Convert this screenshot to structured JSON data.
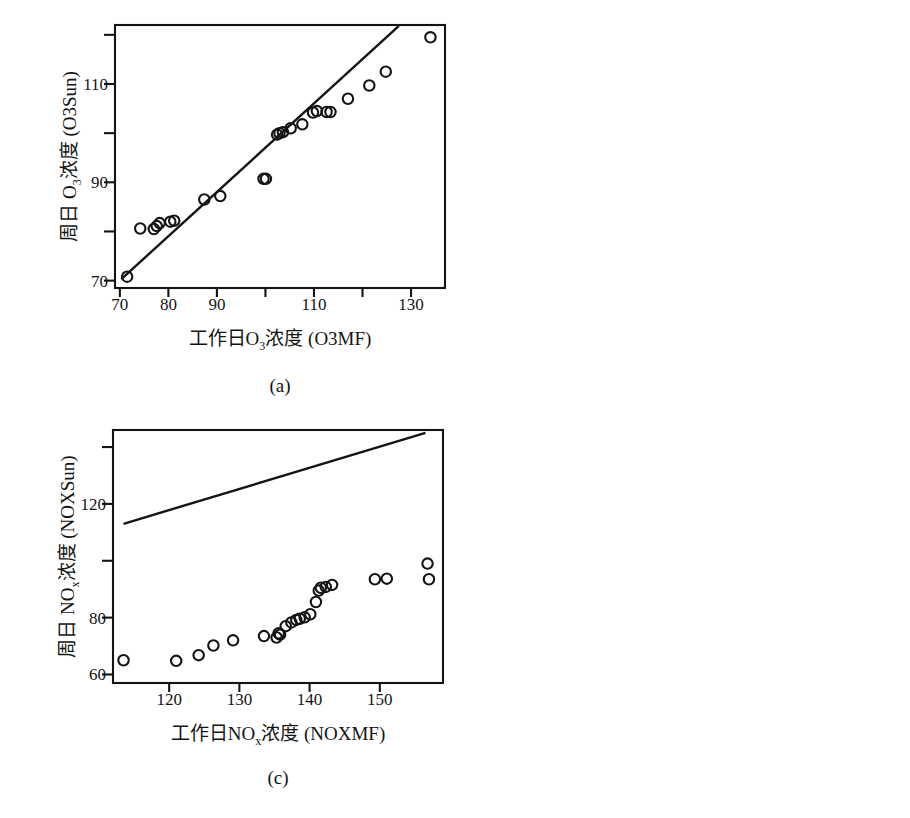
{
  "figure": {
    "title": "",
    "panel_count": 4,
    "layout": "2x2 grid",
    "marker": "open-circle",
    "line_color": "#141414",
    "background": "#ffffff"
  },
  "chart_data": [
    {
      "type": "scatter",
      "panel": "a",
      "caption": "(a)",
      "title": "",
      "xlabel": "工作日O₃浓度 (O3MF)",
      "xlabel_parts": {
        "pre": "工作日O",
        "sub": "3",
        "post": "浓度 (O3MF)"
      },
      "ylabel": "周日 O₃浓度 (O3Sun)",
      "ylabel_parts": {
        "pre": "周日 O",
        "sub": "3",
        "post": "浓度 (O3Sun)"
      },
      "xlim": [
        69,
        137
      ],
      "ylim": [
        68.5,
        122
      ],
      "xticks": [
        70,
        80,
        90,
        100,
        110,
        120,
        130
      ],
      "xticklabels": [
        "70",
        "80",
        "90",
        "",
        "110",
        "",
        "130"
      ],
      "yticks": [
        70,
        80,
        90,
        100,
        110,
        120
      ],
      "yticklabels": [
        "70",
        "",
        "90",
        "",
        "110",
        ""
      ],
      "grid": false,
      "legend": "none",
      "reference_line": {
        "name": "y=x identity line",
        "x": [
          70.3,
          127.5
        ],
        "y": [
          70.3,
          121.8
        ]
      },
      "series": [
        {
          "name": "O3 weekend vs weekday",
          "x": [
            71.5,
            74.2,
            77.0,
            77.6,
            78.2,
            80.4,
            81.2,
            87.4,
            90.7,
            99.6,
            100.1,
            102.4,
            102.9,
            103.6,
            105.2,
            107.6,
            109.8,
            110.6,
            112.6,
            113.4,
            117.0,
            121.4,
            124.8,
            134.0
          ],
          "y": [
            70.8,
            80.6,
            80.5,
            81.1,
            81.7,
            82.0,
            82.2,
            86.5,
            87.2,
            90.7,
            90.7,
            99.7,
            100.0,
            100.2,
            101.0,
            101.8,
            104.2,
            104.5,
            104.3,
            104.3,
            107.0,
            109.7,
            112.5,
            119.5
          ]
        }
      ]
    },
    {
      "type": "scatter",
      "panel": "b",
      "caption": "(b)",
      "title": "",
      "xlabel": "工作日CO浓度 (COMF)",
      "ylabel": "周日 CO浓度 (COSun)",
      "xlim": [
        2.25,
        9.65
      ],
      "ylim": [
        1.25,
        6.85
      ],
      "xticks": [
        3,
        4,
        5,
        6,
        7,
        8,
        9
      ],
      "xticklabels": [
        "3",
        "4",
        "5",
        "6",
        "7",
        "8",
        "9"
      ],
      "yticks": [
        2,
        3,
        4,
        5,
        6
      ],
      "yticklabels": [
        "2",
        "3",
        "4",
        "5",
        "6"
      ],
      "grid": false,
      "legend": "none",
      "reference_line": {
        "name": "y=x identity line",
        "x": [
          2.3,
          6.85
        ],
        "y": [
          2.2,
          6.8
        ]
      },
      "series": [
        {
          "name": "CO weekend vs weekday",
          "x": [
            2.48,
            2.72,
            2.9,
            3.05,
            3.2,
            3.35,
            3.55,
            4.0,
            4.25,
            4.4,
            4.5,
            4.55,
            4.6,
            4.7,
            5.1,
            5.5,
            6.2,
            7.35,
            7.5,
            7.65,
            7.8,
            8.2,
            8.45,
            8.75,
            9.3
          ],
          "y": [
            1.5,
            1.68,
            1.76,
            1.85,
            1.93,
            2.02,
            2.05,
            2.45,
            2.55,
            2.62,
            2.85,
            2.88,
            2.93,
            3.0,
            3.12,
            3.5,
            3.9,
            3.9,
            4.22,
            4.3,
            4.47,
            4.8,
            5.88,
            6.25,
            6.55
          ]
        }
      ]
    },
    {
      "type": "scatter",
      "panel": "c",
      "caption": "(c)",
      "title": "",
      "xlabel": "工作日NOₓ浓度 (NOXMF)",
      "xlabel_parts": {
        "pre": "工作日NO",
        "sub": "x",
        "post": "浓度 (NOXMF)"
      },
      "ylabel": "周日 NOₓ浓度 (NOXSun)",
      "ylabel_parts": {
        "pre": "周日 NO",
        "sub": "x",
        "post": "浓度 (NOXSun)"
      },
      "xlim": [
        112,
        159
      ],
      "ylim": [
        57,
        146
      ],
      "xticks": [
        120,
        130,
        140,
        150
      ],
      "xticklabels": [
        "120",
        "130",
        "140",
        "150"
      ],
      "yticks": [
        60,
        80,
        100,
        120,
        140
      ],
      "yticklabels": [
        "60",
        "80",
        "",
        "120",
        ""
      ],
      "grid": false,
      "legend": "none",
      "reference_line": {
        "name": "regression / identity reference line",
        "x": [
          113.5,
          156.5
        ],
        "y": [
          113.0,
          145.0
        ]
      },
      "series": [
        {
          "name": "NOx weekend vs weekday",
          "x": [
            113.5,
            121.0,
            124.2,
            126.3,
            129.1,
            133.5,
            135.3,
            135.6,
            135.8,
            136.6,
            137.4,
            138.1,
            138.6,
            139.3,
            140.1,
            140.9,
            141.3,
            141.6,
            142.3,
            143.2,
            149.3,
            151.0,
            156.8,
            157.0
          ],
          "y": [
            65.0,
            64.8,
            66.8,
            70.2,
            72.0,
            73.5,
            73.0,
            74.5,
            74.0,
            77.0,
            78.3,
            79.2,
            79.6,
            80.1,
            81.2,
            85.5,
            89.5,
            90.5,
            90.8,
            91.5,
            93.5,
            93.7,
            99.0,
            93.5
          ]
        }
      ]
    },
    {
      "type": "scatter",
      "panel": "d",
      "caption": "(d)",
      "title": "",
      "xlabel": "工作日PM10浓度 (PM10MF)",
      "ylabel": "周日 PM10浓度 (PM10Sun)",
      "xlim": [
        74,
        142
      ],
      "ylim": [
        51,
        122
      ],
      "xticks": [
        80,
        90,
        100,
        110,
        120,
        130,
        140
      ],
      "xticklabels": [
        "80",
        "90",
        "",
        "110",
        "",
        "130",
        ""
      ],
      "yticks": [
        60,
        80,
        100,
        120
      ],
      "yticklabels": [
        "60",
        "80",
        "100",
        ""
      ],
      "grid": false,
      "legend": "none",
      "reference_line": {
        "name": "y=x identity line",
        "x": [
          74.5,
          131.5
        ],
        "y": [
          73.5,
          121.0
        ]
      },
      "series": [
        {
          "name": "PM10 weekend vs weekday",
          "x": [
            76.0,
            76.6,
            77.4,
            78.2,
            78.8,
            79.2,
            79.6,
            80.0,
            80.2,
            85.0,
            85.4,
            89.0,
            92.5,
            103.0,
            108.0,
            108.3,
            108.5,
            131.0,
            139.0
          ],
          "y": [
            54.3,
            55.4,
            56.0,
            57.0,
            57.6,
            58.6,
            59.6,
            60.4,
            61.2,
            66.3,
            66.6,
            71.7,
            71.5,
            77.5,
            89.5,
            90.6,
            91.3,
            92.0,
            119.2
          ]
        }
      ]
    }
  ]
}
